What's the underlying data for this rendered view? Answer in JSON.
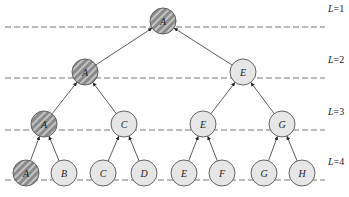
{
  "diagram": {
    "levels": [
      {
        "label": "L=1",
        "y": 27
      },
      {
        "label": "L=2",
        "y": 78
      },
      {
        "label": "L=3",
        "y": 130
      },
      {
        "label": "L=4",
        "y": 180
      }
    ],
    "nodes": [
      {
        "id": "n1",
        "label": "A",
        "x": 163,
        "y": 21,
        "hatched": true
      },
      {
        "id": "n2",
        "label": "A",
        "x": 85,
        "y": 72,
        "hatched": true
      },
      {
        "id": "n3",
        "label": "E",
        "x": 243,
        "y": 72,
        "hatched": false
      },
      {
        "id": "n4",
        "label": "A",
        "x": 44,
        "y": 124,
        "hatched": true
      },
      {
        "id": "n5",
        "label": "C",
        "x": 124,
        "y": 124,
        "hatched": false
      },
      {
        "id": "n6",
        "label": "E",
        "x": 203,
        "y": 124,
        "hatched": false
      },
      {
        "id": "n7",
        "label": "G",
        "x": 282,
        "y": 124,
        "hatched": false
      },
      {
        "id": "n8",
        "label": "A",
        "x": 26,
        "y": 173,
        "hatched": true
      },
      {
        "id": "n9",
        "label": "B",
        "x": 64,
        "y": 173,
        "hatched": false
      },
      {
        "id": "n10",
        "label": "C",
        "x": 103,
        "y": 173,
        "hatched": false
      },
      {
        "id": "n11",
        "label": "D",
        "x": 144,
        "y": 173,
        "hatched": false
      },
      {
        "id": "n12",
        "label": "E",
        "x": 184,
        "y": 173,
        "hatched": false
      },
      {
        "id": "n13",
        "label": "F",
        "x": 222,
        "y": 173,
        "hatched": false
      },
      {
        "id": "n14",
        "label": "G",
        "x": 264,
        "y": 173,
        "hatched": false
      },
      {
        "id": "n15",
        "label": "H",
        "x": 302,
        "y": 173,
        "hatched": false
      }
    ],
    "edges": [
      [
        "n2",
        "n1"
      ],
      [
        "n3",
        "n1"
      ],
      [
        "n4",
        "n2"
      ],
      [
        "n5",
        "n2"
      ],
      [
        "n6",
        "n3"
      ],
      [
        "n7",
        "n3"
      ],
      [
        "n8",
        "n4"
      ],
      [
        "n9",
        "n4"
      ],
      [
        "n10",
        "n5"
      ],
      [
        "n11",
        "n5"
      ],
      [
        "n12",
        "n6"
      ],
      [
        "n13",
        "n6"
      ],
      [
        "n14",
        "n7"
      ],
      [
        "n15",
        "n7"
      ]
    ],
    "colors": {
      "hatched_fill": "#8a8a8a",
      "hatch_stripe": "#c4c4c4",
      "plain_fill": "#e6e6e6",
      "stroke": "#555555",
      "dash": "#777777"
    }
  }
}
